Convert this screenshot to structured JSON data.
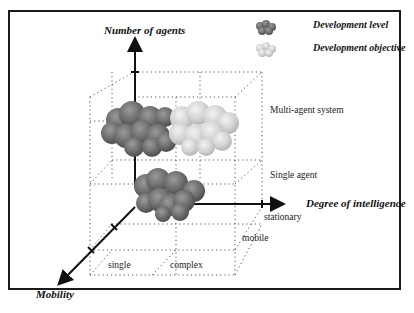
{
  "axes": {
    "y": {
      "title": "Number of agents",
      "ticks": [
        "Single agent",
        "Multi-agent system"
      ]
    },
    "x": {
      "title": "Degree of intelligence",
      "ticks": [
        "single",
        "complex"
      ]
    },
    "z": {
      "title": "Mobility",
      "ticks": [
        "stationary",
        "mobile"
      ]
    }
  },
  "legend": {
    "items": [
      {
        "label": "Development level",
        "color": "#6f6f6f"
      },
      {
        "label": "Development objective",
        "color": "#d4d4d4"
      }
    ]
  },
  "clusters": [
    {
      "name": "development-level-multi-agent",
      "series": "Development level",
      "position": "multi-agent, single intelligence"
    },
    {
      "name": "development-objective-multi-agent",
      "series": "Development objective",
      "position": "multi-agent, complex intelligence"
    },
    {
      "name": "development-level-single-agent",
      "series": "Development level",
      "position": "single agent, single-to-complex intelligence"
    }
  ]
}
